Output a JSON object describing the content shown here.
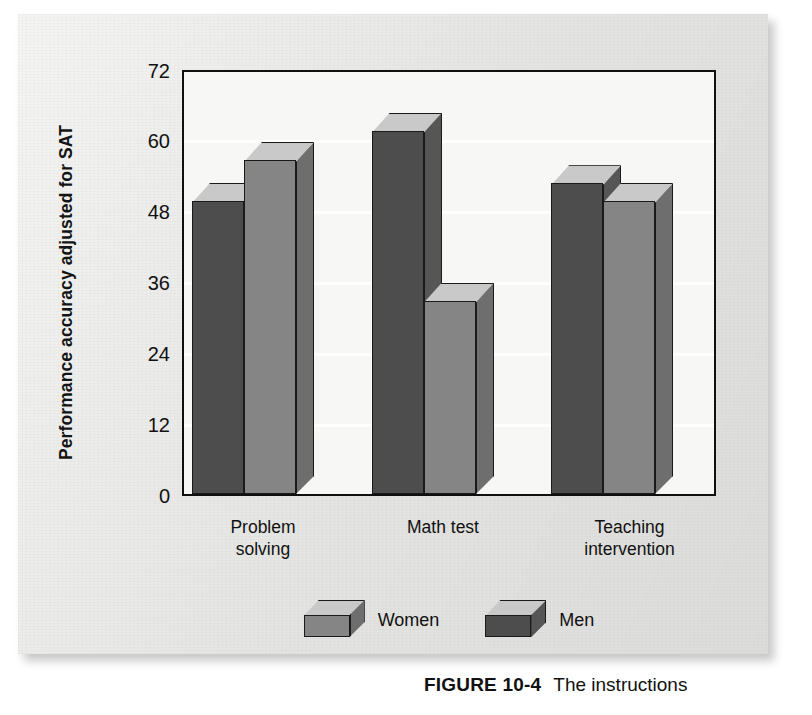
{
  "figure": {
    "number_label": "FIGURE 10-4",
    "caption_text": "The instructions"
  },
  "axis": {
    "y_title": "Performance accuracy adjusted for SAT",
    "y_ticks": [
      "0",
      "12",
      "24",
      "36",
      "48",
      "60",
      "72"
    ]
  },
  "legend": {
    "items": [
      {
        "label": "Women",
        "swatch": "light-gray-3d-block",
        "color": "#858585"
      },
      {
        "label": "Men",
        "swatch": "dark-gray-3d-block",
        "color": "#4d4d4d"
      }
    ]
  },
  "categories": [
    {
      "label": "Problem\nsolving"
    },
    {
      "label": "Math test"
    },
    {
      "label": "Teaching\nintervention"
    }
  ],
  "chart_data": {
    "type": "bar",
    "title": "",
    "subtitle": "",
    "xlabel": "",
    "ylabel": "Performance accuracy adjusted for SAT",
    "categories": [
      "Problem solving",
      "Math test",
      "Teaching intervention"
    ],
    "series": [
      {
        "name": "Men",
        "color": "#4d4d4d",
        "values": [
          50,
          62,
          53
        ]
      },
      {
        "name": "Women",
        "color": "#858585",
        "values": [
          57,
          33,
          50
        ]
      }
    ],
    "ylim": [
      0,
      72
    ],
    "yticks": [
      0,
      12,
      24,
      36,
      48,
      60,
      72
    ],
    "grid": true,
    "grid_axis": "y",
    "legend_position": "bottom-center",
    "three_d": true,
    "bar_order_in_group": [
      "Men",
      "Women"
    ],
    "annotations": []
  },
  "colors": {
    "bar_dark_front": "#4d4d4d",
    "bar_dark_side": "#565656",
    "bar_light_front": "#858585",
    "bar_light_side": "#6e6e6e",
    "bar_top": "#c9c9c9",
    "plot_background": "#f7f7f5",
    "paper_background": "#e8e8e6",
    "outline": "#101010"
  }
}
